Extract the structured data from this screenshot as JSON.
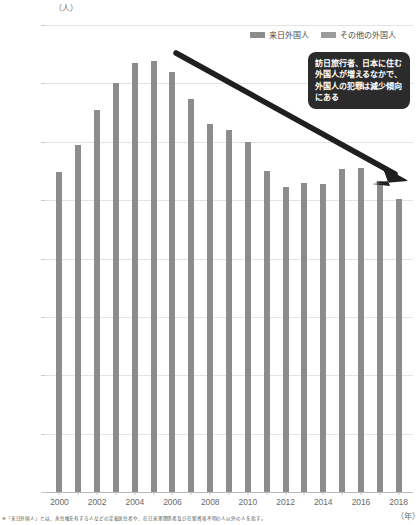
{
  "chart_data": {
    "type": "bar",
    "title": "",
    "xlabel": "(年)",
    "ylabel": "(人)",
    "ylim": [
      0,
      16000
    ],
    "ystep": 2000,
    "ytick_labels": [
      "16,000",
      "14,000",
      "12,000",
      "10,000",
      "8,000",
      "6,000",
      "4,000",
      "2,000",
      "0"
    ],
    "ytick_values": [
      16000,
      14000,
      12000,
      10000,
      8000,
      6000,
      4000,
      2000,
      0
    ],
    "grid": true,
    "legend_position": "top-right",
    "legend": [
      "来日外国人",
      "その他の外国人"
    ],
    "categories": [
      2000,
      2001,
      2002,
      2003,
      2004,
      2005,
      2006,
      2007,
      2008,
      2009,
      2010,
      2011,
      2012,
      2013,
      2014,
      2015,
      2016,
      2017,
      2018
    ],
    "xtick_labels": [
      "2000",
      "",
      "2002",
      "",
      "2004",
      "",
      "2006",
      "",
      "2008",
      "",
      "2010",
      "",
      "2012",
      "",
      "2014",
      "",
      "2016",
      "",
      "2018"
    ],
    "values": [
      10950,
      11900,
      13100,
      14000,
      14700,
      14750,
      14400,
      13450,
      12600,
      12400,
      12000,
      11000,
      10450,
      10600,
      10550,
      11050,
      11100,
      10650,
      10050
    ],
    "series": [
      {
        "name": "来日外国人",
        "values": [
          10950,
          11900,
          13100,
          14000,
          14700,
          14750,
          14400,
          13450,
          12600,
          12400,
          12000,
          11000,
          10450,
          10600,
          10550,
          11050,
          11100,
          10650,
          10050
        ]
      }
    ],
    "annotations": [
      {
        "name": "trend-callout",
        "text": "訪日旅行者、日本に住む外国人が増えるなかで、外国人の犯罪は減少傾向にある"
      },
      {
        "name": "trend-arrow",
        "direction": "down-right"
      }
    ]
  },
  "axis": {
    "y_unit": "（人）",
    "x_unit": "（年）"
  },
  "legend": {
    "items": [
      {
        "label": "来日外国人",
        "color": "#8c8c8c"
      },
      {
        "label": "その他の外国人",
        "color": "#9b9b9b"
      }
    ]
  },
  "callout": {
    "text": "訪日旅行者、日本に住む外国人が増えるなかで、外国人の犯罪は減少傾向にある",
    "background": "#2b2b2b",
    "text_color": "#ffffff"
  },
  "footnote": {
    "text": "※「来日外国人」とは、永住権を有する人などの定着居住者や、在日米軍関係者及び在留資格不明の人以外の人を指す。"
  },
  "colors": {
    "bar": "#8c8c8c",
    "grid": "#e4e4e4",
    "axis": "#b9b9b9",
    "text": "#6b6b6b",
    "accent": "#2b2b2b"
  }
}
